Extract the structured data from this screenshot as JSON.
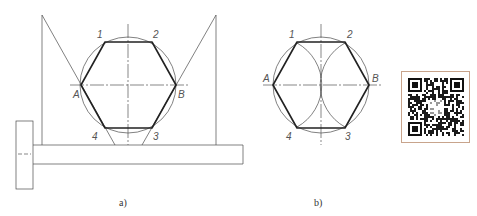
{
  "figure_a": {
    "caption": "a)",
    "labels": {
      "p1": "1",
      "p2": "2",
      "p3": "3",
      "p4": "4",
      "A": "A",
      "B": "B"
    }
  },
  "figure_b": {
    "caption": "b)",
    "labels": {
      "p1": "1",
      "p2": "2",
      "p3": "3",
      "p4": "4",
      "A": "A",
      "B": "B"
    }
  },
  "qr_code": {
    "icon": "qr-code-icon",
    "border_color": "#c8a48c"
  },
  "colors": {
    "line": "#4a4a4a",
    "thick_line": "#222222",
    "label": "#555555"
  }
}
